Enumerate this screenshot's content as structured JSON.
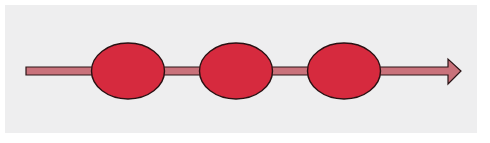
{
  "diagram": {
    "type": "timeline-arrow-with-nodes",
    "direction": "left-to-right",
    "node_count": 3,
    "nodes": [
      {
        "id": "node-1",
        "shape": "ellipse",
        "label": ""
      },
      {
        "id": "node-2",
        "shape": "ellipse",
        "label": ""
      },
      {
        "id": "node-3",
        "shape": "ellipse",
        "label": ""
      }
    ],
    "colors": {
      "background": "#ffffff",
      "panel": "#eeeeef",
      "arrow_fill": "#c9727b",
      "arrow_stroke": "#2a1416",
      "node_fill": "#d62a3e",
      "node_stroke": "#2a1012"
    }
  }
}
